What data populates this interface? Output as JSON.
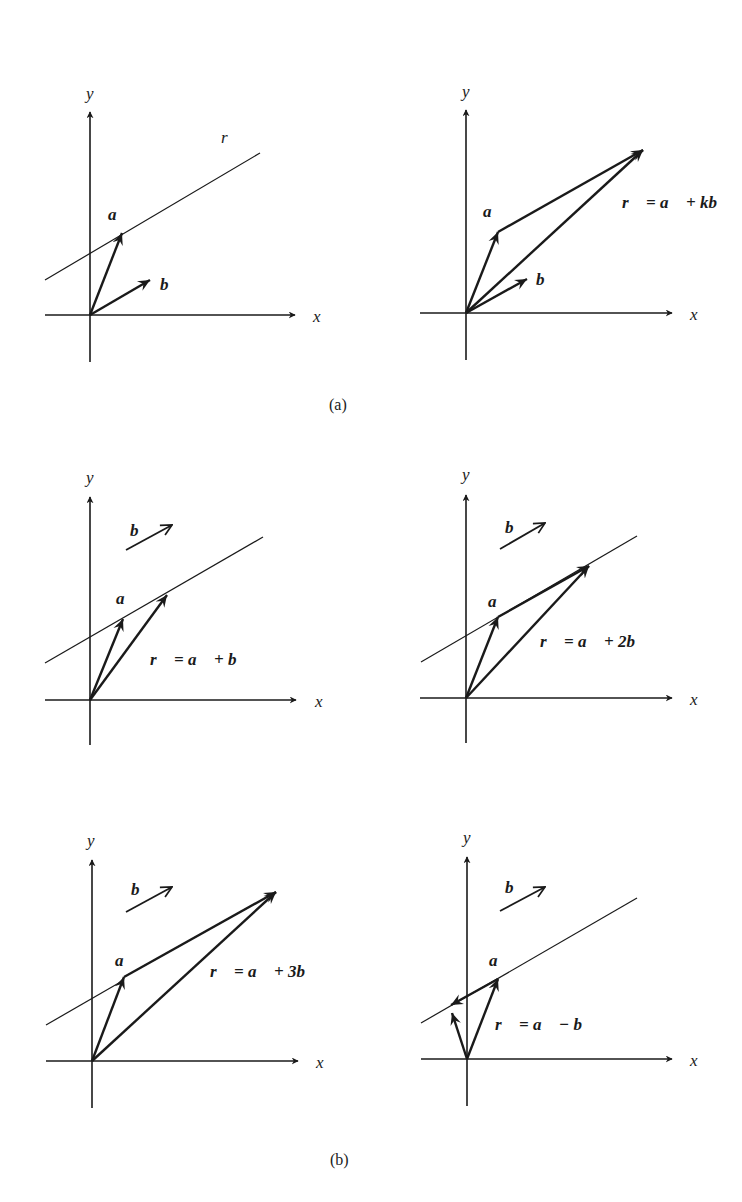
{
  "figure": {
    "captions": {
      "a": "(a)",
      "b": "(b)"
    },
    "axis_labels": {
      "x": "x",
      "y": "y"
    },
    "line_label": "r",
    "vector_labels": {
      "a": "a⃗",
      "b": "b⃗"
    },
    "panels": [
      {
        "id": "a-left",
        "group": "a",
        "equation": "",
        "shows_line": true,
        "line_label_visible": true
      },
      {
        "id": "a-right",
        "group": "a",
        "equation": "r⃗ = a⃗ + kb⃗",
        "shows_line": false
      },
      {
        "id": "b-k1",
        "group": "b",
        "equation": "r⃗ = a⃗ + b⃗",
        "shows_line": true,
        "k": 1
      },
      {
        "id": "b-k2",
        "group": "b",
        "equation": "r⃗ = a⃗ + 2b⃗",
        "shows_line": true,
        "k": 2
      },
      {
        "id": "b-k3",
        "group": "b",
        "equation": "r⃗ = a⃗ + 3b⃗",
        "shows_line": true,
        "k": 3
      },
      {
        "id": "b-kminus1",
        "group": "b",
        "equation": "r⃗ = a⃗ − b⃗",
        "shows_line": true,
        "k": -1
      }
    ],
    "colors": {
      "ink": "#1a1a1a",
      "background": "#ffffff"
    }
  }
}
